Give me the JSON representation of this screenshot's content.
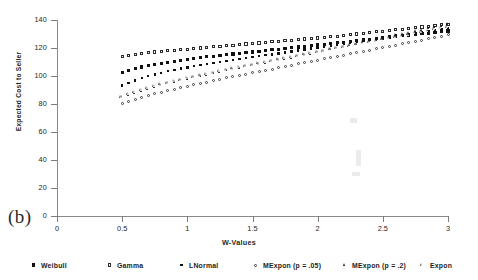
{
  "figure": {
    "panel_label": "(b)"
  },
  "chart_data": {
    "type": "scatter",
    "title": "",
    "xlabel": "W-Values",
    "ylabel": "Expected Cost to Seller",
    "xlim": [
      0,
      3
    ],
    "ylim": [
      0,
      140
    ],
    "xticks": [
      "0",
      "0.5",
      "1",
      "1.5",
      "2",
      "2.5",
      "3"
    ],
    "xtick_values": [
      0,
      0.5,
      1,
      1.5,
      2,
      2.5,
      3
    ],
    "yticks": [
      "0",
      "20",
      "40",
      "60",
      "80",
      "100",
      "120",
      "140"
    ],
    "ytick_values": [
      0,
      20,
      40,
      60,
      80,
      100,
      120,
      140
    ],
    "grid": false,
    "legend_position": "below",
    "x": [
      0.5,
      0.55,
      0.6,
      0.65,
      0.7,
      0.75,
      0.8,
      0.85,
      0.9,
      0.95,
      1.0,
      1.05,
      1.1,
      1.15,
      1.2,
      1.25,
      1.3,
      1.35,
      1.4,
      1.45,
      1.5,
      1.55,
      1.6,
      1.65,
      1.7,
      1.75,
      1.8,
      1.85,
      1.9,
      1.95,
      2.0,
      2.05,
      2.1,
      2.15,
      2.2,
      2.25,
      2.3,
      2.35,
      2.4,
      2.45,
      2.5,
      2.55,
      2.6,
      2.65,
      2.7,
      2.75,
      2.8,
      2.85,
      2.9,
      2.95,
      3.0
    ],
    "series": [
      {
        "name": "Weibull",
        "marker": "filled-square",
        "values": [
          102.5,
          104.0,
          105.3,
          106.4,
          107.4,
          108.3,
          109.1,
          109.9,
          110.6,
          111.3,
          111.9,
          112.5,
          113.1,
          113.7,
          114.2,
          114.7,
          115.2,
          115.7,
          116.2,
          116.7,
          117.2,
          117.7,
          118.2,
          118.7,
          119.2,
          119.7,
          120.2,
          120.7,
          121.2,
          121.7,
          122.2,
          122.7,
          123.2,
          123.7,
          124.2,
          124.7,
          125.2,
          125.7,
          126.2,
          126.7,
          127.2,
          127.7,
          128.2,
          128.7,
          129.2,
          129.7,
          130.2,
          130.7,
          131.2,
          131.7,
          132.2
        ]
      },
      {
        "name": "Gamma",
        "marker": "open-square",
        "values": [
          114.2,
          114.9,
          115.5,
          116.1,
          116.6,
          117.1,
          117.6,
          118.0,
          118.4,
          118.8,
          119.2,
          119.6,
          120.0,
          120.4,
          120.8,
          121.2,
          121.6,
          122.0,
          122.4,
          122.8,
          123.2,
          123.6,
          124.0,
          124.4,
          124.8,
          125.2,
          125.6,
          126.0,
          126.4,
          126.8,
          127.2,
          127.6,
          128.0,
          128.5,
          129.0,
          129.5,
          130.0,
          130.5,
          131.0,
          131.5,
          132.0,
          132.5,
          133.0,
          133.5,
          134.0,
          134.5,
          135.0,
          135.5,
          136.0,
          136.5,
          137.0
        ]
      },
      {
        "name": "LNormal",
        "marker": "small-filled-square",
        "values": [
          93.3,
          95.2,
          96.9,
          98.4,
          99.8,
          101.1,
          102.3,
          103.4,
          104.4,
          105.3,
          106.2,
          107.0,
          107.8,
          108.5,
          109.2,
          109.9,
          110.6,
          111.3,
          112.0,
          112.7,
          113.4,
          114.1,
          114.8,
          115.5,
          116.2,
          116.9,
          117.6,
          118.3,
          119.0,
          119.7,
          120.4,
          121.1,
          121.8,
          122.5,
          123.2,
          123.9,
          124.6,
          125.3,
          126.0,
          126.7,
          127.4,
          128.1,
          128.8,
          129.5,
          130.2,
          130.9,
          131.6,
          132.3,
          133.0,
          133.7,
          134.4
        ]
      },
      {
        "name": "MExpon (p = .05)",
        "marker": "open-circle",
        "values": [
          80.4,
          82.0,
          83.5,
          84.9,
          86.2,
          87.4,
          88.5,
          89.6,
          90.6,
          91.6,
          92.6,
          93.6,
          94.6,
          95.6,
          96.6,
          97.6,
          98.6,
          99.6,
          100.5,
          101.4,
          102.3,
          103.2,
          104.1,
          105.0,
          105.9,
          106.8,
          107.7,
          108.6,
          109.5,
          110.4,
          111.3,
          112.2,
          113.1,
          114.0,
          114.9,
          115.8,
          116.7,
          117.6,
          118.5,
          119.4,
          120.3,
          121.2,
          122.1,
          123.0,
          123.9,
          124.8,
          125.7,
          126.6,
          127.5,
          128.4,
          129.3
        ]
      },
      {
        "name": "MExpon (p = .2)",
        "marker": "filled-triangle",
        "values": [
          84.7,
          86.5,
          88.1,
          89.6,
          91.0,
          92.3,
          93.5,
          94.7,
          95.8,
          96.9,
          98.0,
          99.0,
          100.0,
          101.0,
          102.0,
          103.0,
          104.0,
          105.0,
          105.9,
          106.8,
          107.7,
          108.6,
          109.5,
          110.4,
          111.3,
          112.2,
          113.1,
          114.0,
          115.0,
          116.0,
          117.0,
          118.0,
          119.0,
          120.0,
          121.0,
          122.0,
          123.0,
          124.0,
          125.0,
          126.0,
          127.0,
          128.0,
          129.0,
          130.0,
          131.0,
          132.0,
          133.0,
          134.0,
          135.0,
          136.0,
          137.5
        ]
      },
      {
        "name": "Expon",
        "marker": "open-triangle",
        "values": [
          85.2,
          87.0,
          88.6,
          90.1,
          91.5,
          92.8,
          94.0,
          95.2,
          96.3,
          97.4,
          98.5,
          99.5,
          100.5,
          101.5,
          102.5,
          103.5,
          104.5,
          105.5,
          106.4,
          107.3,
          108.2,
          109.1,
          110.0,
          110.9,
          111.8,
          112.7,
          113.6,
          114.5,
          115.4,
          116.3,
          117.2,
          118.1,
          119.0,
          119.9,
          120.8,
          121.7,
          122.6,
          123.5,
          124.4,
          125.3,
          126.2,
          127.1,
          128.0,
          128.9,
          129.8,
          130.7,
          131.6,
          132.5,
          133.4,
          134.3,
          135.2
        ]
      }
    ]
  },
  "legend": {
    "items": [
      {
        "label": "Weibull",
        "marker": "filled-square",
        "x": 30
      },
      {
        "label": "Gamma",
        "marker": "open-square",
        "x": 106
      },
      {
        "label": "LNormal",
        "marker": "small-filled-square",
        "x": 178
      },
      {
        "label": "MExpon (p = .05)",
        "marker": "open-circle",
        "x": 252
      },
      {
        "label": "MExpon (p = .2)",
        "marker": "filled-triangle",
        "x": 341
      },
      {
        "label": "Expon",
        "marker": "open-triangle",
        "x": 419
      }
    ]
  }
}
